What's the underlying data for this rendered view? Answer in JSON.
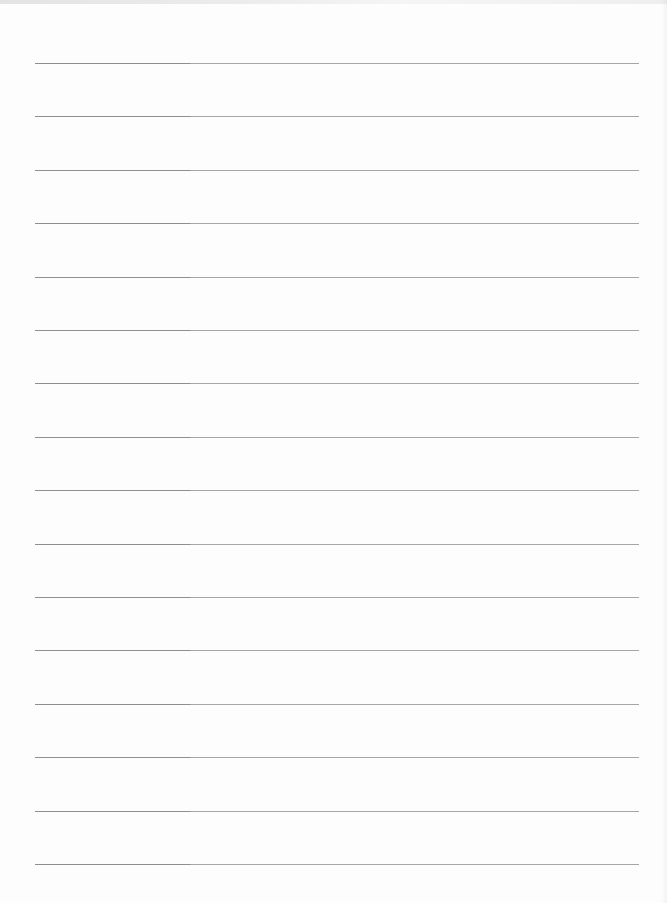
{
  "page": {
    "type": "lined-paper",
    "background_color": "#fdfdfd",
    "line_color": "#a6a6a6",
    "line_count": 16,
    "first_line_y": 63,
    "line_spacing": 53.4,
    "line_left": 35,
    "line_right": 639,
    "text": ""
  }
}
